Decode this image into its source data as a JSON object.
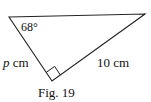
{
  "figure": {
    "caption": "Fig. 19",
    "angle_label": "68°",
    "side_p_var": "p",
    "side_p_unit": " cm",
    "side_hyp_label": "10 cm",
    "right_angle_marker": true,
    "vertices": {
      "top_left": [
        9,
        17
      ],
      "top_right": [
        145,
        14
      ],
      "bottom_right_angle": [
        52,
        81
      ]
    },
    "colors": {
      "line": "#222222",
      "background": "#ffffff"
    }
  }
}
